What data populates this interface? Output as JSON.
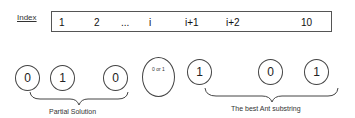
{
  "index_row": {
    "label": "Index",
    "cells": [
      {
        "text": "1",
        "x": 7
      },
      {
        "text": "2",
        "x": 42
      },
      {
        "text": "...",
        "x": 69
      },
      {
        "text": "i",
        "x": 97
      },
      {
        "text": "i+1",
        "x": 133
      },
      {
        "text": "i+2",
        "x": 174
      },
      {
        "text": "10",
        "x": 249
      }
    ]
  },
  "bits": [
    {
      "value": "0",
      "x": 15
    },
    {
      "value": "1",
      "x": 50
    },
    {
      "value": "0",
      "x": 103
    },
    {
      "value": "1",
      "x": 187
    },
    {
      "value": "0",
      "x": 258
    },
    {
      "value": "1",
      "x": 304
    }
  ],
  "unknown_bit": {
    "label": "0 or 1"
  },
  "groups": {
    "partial_solution": "Partial Solution",
    "best_ant_substring": "The best Ant substring"
  }
}
